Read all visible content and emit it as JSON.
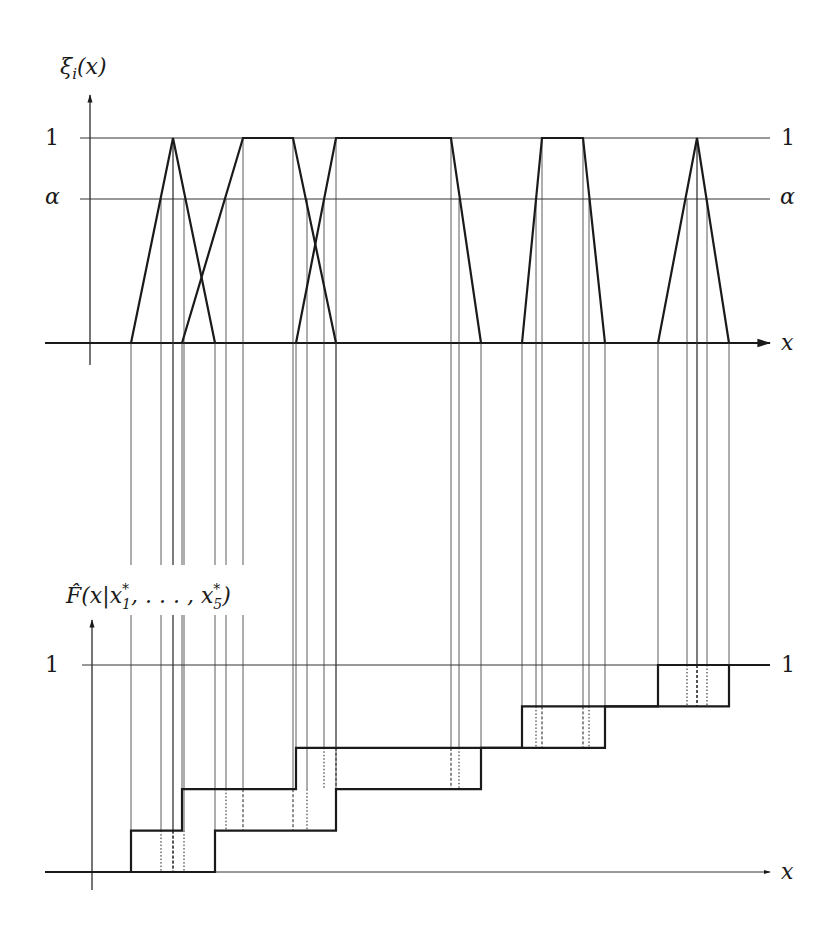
{
  "top_chart": {
    "y_label": "ξ",
    "y_label_sub": "i",
    "y_label_arg": "(x)",
    "x_label": "x",
    "level_one_label": "1",
    "level_alpha_label": "α",
    "right_one_label": "1",
    "right_alpha_label": "α",
    "fuzzy_numbers": [
      {
        "name": "x1*",
        "shape": "triangle",
        "support": [
          131,
          215
        ],
        "core": [
          173,
          173
        ],
        "alpha_cut": [
          161,
          184
        ]
      },
      {
        "name": "x2*",
        "shape": "trapezoid",
        "support": [
          182,
          336
        ],
        "core": [
          243,
          293
        ],
        "alpha_cut": [
          226,
          307
        ]
      },
      {
        "name": "x3*",
        "shape": "trapezoid",
        "support": [
          296,
          481
        ],
        "core": [
          336,
          451
        ],
        "alpha_cut": [
          324,
          459
        ]
      },
      {
        "name": "x4*",
        "shape": "trapezoid",
        "support": [
          522,
          605
        ],
        "core": [
          542,
          583
        ],
        "alpha_cut": [
          536,
          589
        ]
      },
      {
        "name": "x5*",
        "shape": "triangle",
        "support": [
          658,
          729
        ],
        "core": [
          697,
          697
        ],
        "alpha_cut": [
          687,
          707
        ]
      }
    ]
  },
  "bottom_chart": {
    "y_label": "F̂(x|x",
    "y_label_sub1": "1",
    "y_label_mid": ", . . . , x",
    "y_label_sub5": "5",
    "y_label_end": ")",
    "star": "*",
    "x_label": "x",
    "level_one_label": "1",
    "right_one_label": "1",
    "steps": 5
  },
  "colors": {
    "ink": "#1a1a1a",
    "thin": "#333333",
    "background": "#ffffff"
  }
}
